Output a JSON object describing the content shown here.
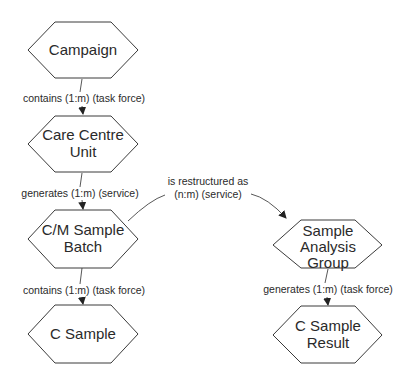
{
  "nodes": {
    "campaign": {
      "label": [
        "Campaign"
      ]
    },
    "care_centre_unit": {
      "label": [
        "Care Centre",
        "Unit"
      ]
    },
    "cm_sample_batch": {
      "label": [
        "C/M Sample",
        "Batch"
      ]
    },
    "c_sample": {
      "label": [
        "C Sample"
      ]
    },
    "sample_analysis_group": {
      "label": [
        "Sample",
        "Analysis",
        "Group"
      ]
    },
    "c_sample_result": {
      "label": [
        "C Sample",
        "Result"
      ]
    }
  },
  "edges": {
    "campaign_to_ccu": {
      "label": "contains (1:m) (task force)"
    },
    "ccu_to_batch": {
      "label": "generates (1:m) (service)"
    },
    "batch_to_csample": {
      "label": "contains (1:m) (task force)"
    },
    "batch_to_sag": {
      "label": [
        "is restructured as",
        "(n:m) (service)"
      ]
    },
    "sag_to_result": {
      "label": "generates (1:m) (task force)"
    }
  }
}
